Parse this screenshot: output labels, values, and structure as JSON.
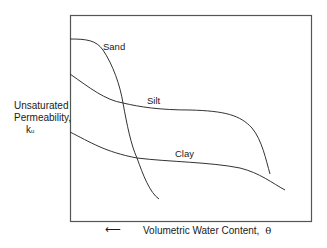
{
  "diagram": {
    "y_axis": {
      "line1": "Unsaturated",
      "line2": "Permeability,",
      "symbol": "k",
      "subscript": "u"
    },
    "x_axis": {
      "arrow": "⟵",
      "label": "Volumetric Water Content,",
      "symbol": "θ"
    },
    "curves": [
      {
        "name": "Sand",
        "color": "#333333"
      },
      {
        "name": "Silt",
        "color": "#333333"
      },
      {
        "name": "Clay",
        "color": "#333333"
      }
    ],
    "frame_color": "#555555"
  }
}
